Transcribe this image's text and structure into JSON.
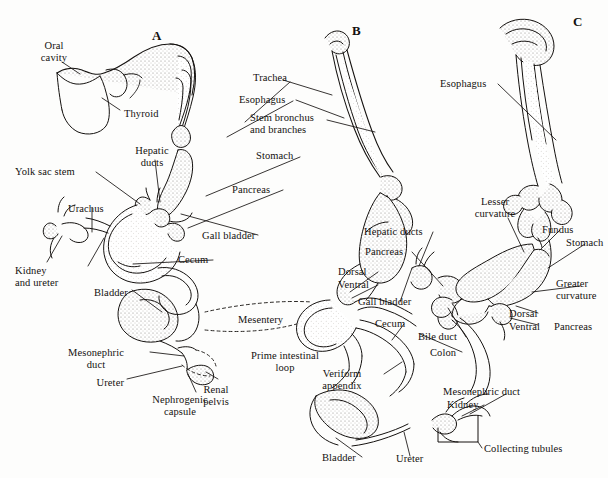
{
  "figure": {
    "background_color": "#fdfdfc",
    "ink_color": "#14110f",
    "stipple_color": "#8f8b85",
    "width": 608,
    "height": 478
  },
  "panels": [
    {
      "id": "A",
      "letter": "A",
      "x": 152,
      "y": 28
    },
    {
      "id": "B",
      "letter": "B",
      "x": 352,
      "y": 23
    },
    {
      "id": "C",
      "letter": "C",
      "x": 573,
      "y": 14
    }
  ],
  "labels": [
    {
      "id": "oral-cavity",
      "text": "Oral\ncavity",
      "x": 48,
      "y": 40,
      "align": "center",
      "panel": "A"
    },
    {
      "id": "thyroid",
      "text": "Thyroid",
      "x": 124,
      "y": 108,
      "align": "left",
      "panel": "A"
    },
    {
      "id": "hepatic-ducts-a",
      "text": "Hepatic\nducts",
      "x": 152,
      "y": 145,
      "align": "center",
      "panel": "A"
    },
    {
      "id": "yolk-sac-stem",
      "text": "Yolk sac stem",
      "x": 15,
      "y": 166,
      "align": "left",
      "panel": "A"
    },
    {
      "id": "urachus",
      "text": "Urachus",
      "x": 68,
      "y": 203,
      "align": "left",
      "panel": "A"
    },
    {
      "id": "kidney-and-ureter",
      "text": "Kidney\nand ureter",
      "x": 15,
      "y": 265,
      "align": "left",
      "panel": "A"
    },
    {
      "id": "bladder-a",
      "text": "Bladder",
      "x": 94,
      "y": 287,
      "align": "left",
      "panel": "A"
    },
    {
      "id": "mesonephric-duct-a",
      "text": "Mesonephric\nduct",
      "x": 96,
      "y": 347,
      "align": "center",
      "panel": "A"
    },
    {
      "id": "ureter-a",
      "text": "Ureter",
      "x": 122,
      "y": 377,
      "align": "right",
      "panel": "A"
    },
    {
      "id": "nephrogenic-capsule",
      "text": "Nephrogenic\ncapsule",
      "x": 180,
      "y": 398,
      "align": "center",
      "panel": "A"
    },
    {
      "id": "renal-pelvis",
      "text": "Renal\npelvis",
      "x": 216,
      "y": 388,
      "align": "center",
      "panel": "A"
    },
    {
      "id": "trachea",
      "text": "Trachea",
      "x": 253,
      "y": 78,
      "align": "left",
      "panel": "B"
    },
    {
      "id": "esophagus-b",
      "text": "Esophagus",
      "x": 239,
      "y": 97,
      "align": "left",
      "panel": "B"
    },
    {
      "id": "stem-bronchus",
      "text": "Stem bronchus\nand branches",
      "x": 250,
      "y": 114,
      "align": "left",
      "panel": "B"
    },
    {
      "id": "stomach-b",
      "text": "Stomach",
      "x": 256,
      "y": 153,
      "align": "left",
      "panel": "B"
    },
    {
      "id": "pancreas-a",
      "text": "Pancreas",
      "x": 232,
      "y": 186,
      "align": "left",
      "panel": "A"
    },
    {
      "id": "gall-bladder-a",
      "text": "Gall bladder",
      "x": 202,
      "y": 232,
      "align": "left",
      "panel": "A"
    },
    {
      "id": "cecum-a",
      "text": "Cecum",
      "x": 178,
      "y": 257,
      "align": "left",
      "panel": "A"
    },
    {
      "id": "mesentery",
      "text": "Mesentery",
      "x": 238,
      "y": 318,
      "align": "left",
      "panel": "A"
    },
    {
      "id": "prime-intestinal",
      "text": "Prime intestinal\nloop",
      "x": 285,
      "y": 354,
      "align": "center",
      "panel": "A"
    },
    {
      "id": "esophagus-c",
      "text": "Esophagus",
      "x": 440,
      "y": 81,
      "align": "left",
      "panel": "C"
    },
    {
      "id": "hepatic-ducts-b",
      "text": "Hepatic ducts",
      "x": 364,
      "y": 228,
      "align": "left",
      "panel": "B"
    },
    {
      "id": "pancreas-b",
      "text": "Pancreas",
      "x": 365,
      "y": 249,
      "align": "left",
      "panel": "B"
    },
    {
      "id": "dorsal-b",
      "text": "Dorsal",
      "x": 338,
      "y": 269,
      "align": "left",
      "panel": "B"
    },
    {
      "id": "ventral-b",
      "text": "Ventral",
      "x": 338,
      "y": 282,
      "align": "left",
      "panel": "B"
    },
    {
      "id": "gall-bladder-b",
      "text": "Gall bladder",
      "x": 358,
      "y": 299,
      "align": "left",
      "panel": "B"
    },
    {
      "id": "cecum-b",
      "text": "Cecum",
      "x": 375,
      "y": 321,
      "align": "left",
      "panel": "B"
    },
    {
      "id": "bile-duct",
      "text": "Bile duct",
      "x": 418,
      "y": 334,
      "align": "left",
      "panel": "B"
    },
    {
      "id": "colon",
      "text": "Colon",
      "x": 430,
      "y": 350,
      "align": "left",
      "panel": "B"
    },
    {
      "id": "veriform-appendix",
      "text": "Veriform\nappendix",
      "x": 342,
      "y": 371,
      "align": "center",
      "panel": "B"
    },
    {
      "id": "mesonephric-duct-c",
      "text": "Mesonephric duct",
      "x": 443,
      "y": 390,
      "align": "left",
      "panel": "C"
    },
    {
      "id": "kidney-c",
      "text": "Kidney",
      "x": 447,
      "y": 402,
      "align": "left",
      "panel": "C"
    },
    {
      "id": "collecting-tubules",
      "text": "Collecting tubules",
      "x": 484,
      "y": 446,
      "align": "left",
      "panel": "C"
    },
    {
      "id": "bladder-b",
      "text": "Bladder",
      "x": 322,
      "y": 455,
      "align": "left",
      "panel": "B"
    },
    {
      "id": "ureter-b",
      "text": "Ureter",
      "x": 396,
      "y": 457,
      "align": "left",
      "panel": "B"
    },
    {
      "id": "lesser-curvature",
      "text": "Lesser\ncurvature",
      "x": 495,
      "y": 200,
      "align": "center",
      "panel": "C"
    },
    {
      "id": "fundus",
      "text": "Fundus",
      "x": 542,
      "y": 227,
      "align": "left",
      "panel": "C"
    },
    {
      "id": "stomach-c",
      "text": "Stomach",
      "x": 566,
      "y": 240,
      "align": "left",
      "panel": "C"
    },
    {
      "id": "greater-curvature",
      "text": "Greater\ncurvature",
      "x": 562,
      "y": 281,
      "align": "left",
      "panel": "C"
    },
    {
      "id": "dorsal-c",
      "text": "Dorsal",
      "x": 509,
      "y": 311,
      "align": "left",
      "panel": "C"
    },
    {
      "id": "ventral-c",
      "text": "Ventral",
      "x": 509,
      "y": 323,
      "align": "left",
      "panel": "C"
    },
    {
      "id": "pancreas-c",
      "text": "Pancreas",
      "x": 558,
      "y": 323,
      "align": "left",
      "panel": "C"
    }
  ]
}
